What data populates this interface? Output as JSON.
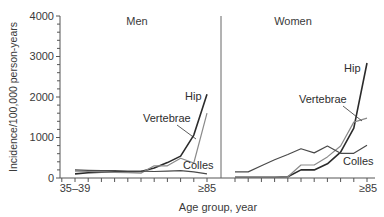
{
  "chart_data": {
    "type": "line",
    "title": "",
    "xlabel": "Age group, year",
    "ylabel": "Incidence/100,000 person-years",
    "ylim": [
      0,
      4000
    ],
    "yticks": [
      0,
      1000,
      2000,
      3000,
      4000
    ],
    "ytick_labels": [
      "0",
      "1000",
      "2000",
      "3000",
      "4000"
    ],
    "grid": false,
    "categories": [
      "35-39",
      "40-44",
      "45-49",
      "50-54",
      "55-59",
      "60-64",
      "65-69",
      "70-74",
      "75-79",
      "80-84",
      "≥85"
    ],
    "xtick_labels_shown": [
      "35–39",
      "≥85"
    ],
    "panels": [
      {
        "name": "Men",
        "series": [
          {
            "name": "Hip",
            "color": "#2b2b2b",
            "values": [
              100,
              130,
              140,
              150,
              150,
              160,
              250,
              380,
              540,
              1060,
              2070
            ]
          },
          {
            "name": "Vertebrae",
            "color": "#8a8a8a",
            "values": [
              170,
              160,
              150,
              140,
              130,
              120,
              300,
              300,
              490,
              370,
              1600
            ]
          },
          {
            "name": "Colles",
            "color": "#4a4a4a",
            "values": [
              200,
              190,
              180,
              180,
              170,
              170,
              160,
              170,
              180,
              150,
              100
            ]
          }
        ],
        "labels": [
          {
            "text": "Hip",
            "series": "Hip"
          },
          {
            "text": "Vertebrae",
            "series": "Vertebrae"
          },
          {
            "text": "Colles",
            "series": "Colles"
          }
        ]
      },
      {
        "name": "Women",
        "series": [
          {
            "name": "Hip",
            "color": "#2b2b2b",
            "values": [
              20,
              20,
              20,
              20,
              30,
              200,
              200,
              350,
              640,
              1230,
              2840
            ]
          },
          {
            "name": "Vertebrae",
            "color": "#8a8a8a",
            "values": [
              20,
              20,
              20,
              20,
              30,
              320,
              320,
              520,
              790,
              1380,
              1480
            ]
          },
          {
            "name": "Colles",
            "color": "#4a4a4a",
            "values": [
              150,
              150,
              300,
              450,
              580,
              720,
              620,
              790,
              610,
              610,
              810
            ]
          }
        ],
        "labels": [
          {
            "text": "Hip",
            "series": "Hip"
          },
          {
            "text": "Vertebrae",
            "series": "Vertebrae"
          },
          {
            "text": "Colles",
            "series": "Colles"
          }
        ]
      }
    ]
  },
  "labels": {
    "panel_men": "Men",
    "panel_women": "Women",
    "hip": "Hip",
    "vertebrae": "Vertebrae",
    "colles": "Colles",
    "x_first": "35–39",
    "x_last": "≥85",
    "xlabel": "Age group, year",
    "ylabel": "Incidence/100,000 person-years",
    "y0": "0",
    "y1000": "1000",
    "y2000": "2000",
    "y3000": "3000",
    "y4000": "4000"
  }
}
